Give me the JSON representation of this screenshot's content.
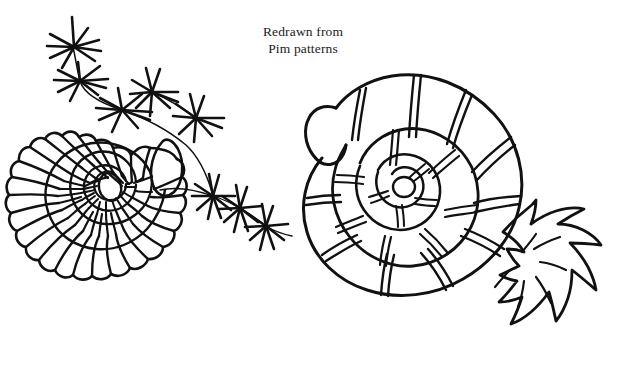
{
  "page": {
    "title": "Redrawn from Pim patterns",
    "background_color": "#ffffff",
    "ink_color": "#111111",
    "width": 623,
    "height": 372,
    "medium": "pen-and-ink line drawing"
  },
  "caption": {
    "line1": "Redrawn from",
    "line2": "Pim patterns",
    "x": 303,
    "line1_y": 36,
    "line2_y": 53,
    "align": "center",
    "font_size_px": 13.5
  },
  "figures": [
    {
      "id": "left-shell",
      "name": "ribbed-spiral-ammonite",
      "description": "Planispiral ammonite shell drawn with radiating ribs and a scalloped, frilled outer margin",
      "center": {
        "x": 112,
        "y": 238
      },
      "outer_radius": 102,
      "whorl_count": 3,
      "rib_count_outer": 22,
      "has_scalloped_margin": true,
      "nucleus": {
        "shape": "oval",
        "rx": 11,
        "ry": 14
      }
    },
    {
      "id": "right-shell",
      "name": "banded-coiled-shell",
      "description": "Thick coiled shell with smooth tube body and paired band lines crossing each whorl",
      "center": {
        "x": 420,
        "y": 205
      },
      "outer_radius": 105,
      "whorl_count": 3,
      "band_pairs": 9,
      "aperture": {
        "x": 340,
        "y": 120,
        "shape": "blunt-rounded-tube"
      }
    },
    {
      "id": "frond",
      "name": "spiky-leaf-frond",
      "description": "Jagged pointed frond or tentacle cluster emerging from the right shell's aperture area",
      "anchor": {
        "x": 512,
        "y": 232
      },
      "lobe_count": 6
    },
    {
      "id": "starburst-chain-upper",
      "name": "starburst-chain-upper-left",
      "description": "Chain of three asterisk-like starbursts connected by a thin curving stem, descending from upper left",
      "burst_count": 3
    },
    {
      "id": "starburst-chain-lower",
      "name": "starburst-chain-lower-right",
      "description": "Chain of starbursts running from the left shell aperture toward the lower right",
      "burst_count": 5
    }
  ],
  "starbursts": [
    {
      "cx": 74,
      "cy": 47,
      "r": 27,
      "rays": 9
    },
    {
      "cx": 80,
      "cy": 81,
      "r": 24,
      "rays": 9
    },
    {
      "cx": 122,
      "cy": 110,
      "r": 27,
      "rays": 9
    },
    {
      "cx": 152,
      "cy": 92,
      "r": 23,
      "rays": 9
    },
    {
      "cx": 196,
      "cy": 118,
      "r": 26,
      "rays": 9
    },
    {
      "cx": 213,
      "cy": 196,
      "r": 22,
      "rays": 9
    },
    {
      "cx": 240,
      "cy": 208,
      "r": 23,
      "rays": 9
    },
    {
      "cx": 266,
      "cy": 226,
      "r": 23,
      "rays": 9
    }
  ],
  "labels": {
    "figure_region": "ink-illustration",
    "left_figure": "left shell illustration",
    "right_figure": "right shell illustration",
    "caption_block": "attribution caption"
  }
}
